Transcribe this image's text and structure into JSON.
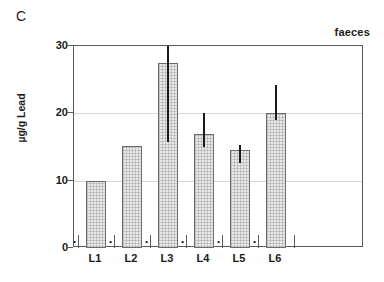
{
  "figure": {
    "panel_label": "C",
    "sample_annotation": "faeces",
    "y_axis_title": "µg/g Lead"
  },
  "chart_data": {
    "type": "bar",
    "title": "C",
    "subtitle": "faeces",
    "xlabel": "",
    "ylabel": "µg/g Lead",
    "categories": [
      "L1",
      "L2",
      "L3",
      "L4",
      "L5",
      "L6"
    ],
    "values": [
      10.0,
      15.1,
      27.5,
      16.9,
      14.6,
      20.0
    ],
    "error_low": [
      null,
      null,
      15.7,
      15.0,
      12.6,
      19.0
    ],
    "error_high": [
      null,
      null,
      30.0,
      20.0,
      15.3,
      24.2
    ],
    "ylim": [
      0,
      30
    ],
    "yticks": [
      0,
      10,
      20,
      30
    ],
    "ytick_labels": [
      "0",
      "10",
      "20",
      "30"
    ],
    "grid": true,
    "grid_axis": "y",
    "legend": false,
    "annotations": [
      {
        "category": "L1",
        "marker": "·",
        "position": "baseline"
      },
      {
        "category": "L2",
        "marker": "·",
        "position": "baseline"
      },
      {
        "category": "L3",
        "marker": "·",
        "position": "baseline"
      },
      {
        "category": "L4",
        "marker": "·",
        "position": "baseline"
      },
      {
        "category": "L5",
        "marker": "·",
        "position": "baseline"
      },
      {
        "category": "L6",
        "marker": "·",
        "position": "baseline"
      }
    ],
    "bar_fill_color": "#e8e8e8",
    "bar_edge_color": "#6b6b6b",
    "errorbar_color": "#1a1a1a",
    "axis_color": "#595959",
    "grid_color": "#d8d8d8"
  }
}
